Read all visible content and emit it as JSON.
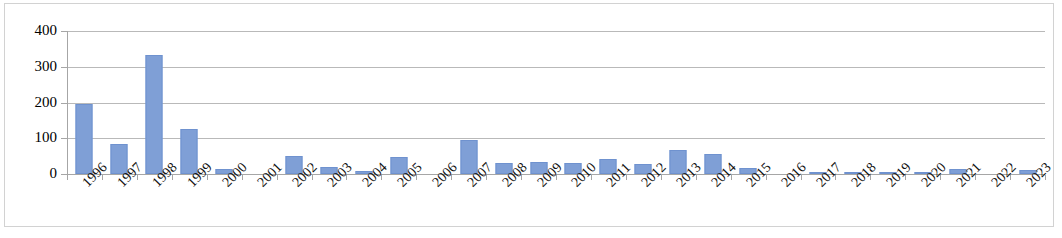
{
  "chart_data": {
    "type": "bar",
    "title": "",
    "subtitle": "",
    "xlabel": "",
    "ylabel": "",
    "ylim": [
      0,
      400
    ],
    "yticks": [
      0,
      100,
      200,
      300,
      400
    ],
    "grid": true,
    "legend": false,
    "legend_position": "none",
    "series_color": "#7f9fd6",
    "categories": [
      "1996",
      "1997",
      "1998",
      "1999",
      "2000",
      "2001",
      "2002",
      "2003",
      "2004",
      "2005",
      "2006",
      "2007",
      "2008",
      "2009",
      "2010",
      "2011",
      "2012",
      "2013",
      "2014",
      "2015",
      "2016",
      "2017",
      "2018",
      "2019",
      "2020",
      "2021",
      "2022",
      "2023"
    ],
    "values": [
      197,
      84,
      332,
      127,
      13,
      0,
      51,
      20,
      9,
      47,
      0,
      96,
      30,
      34,
      30,
      42,
      27,
      68,
      56,
      16,
      0,
      6,
      2,
      3,
      3,
      13,
      0,
      11
    ],
    "series": [
      {
        "name": "",
        "values": [
          197,
          84,
          332,
          127,
          13,
          0,
          51,
          20,
          9,
          47,
          0,
          96,
          30,
          34,
          30,
          42,
          27,
          68,
          56,
          16,
          0,
          6,
          2,
          3,
          3,
          13,
          0,
          11
        ]
      }
    ]
  }
}
